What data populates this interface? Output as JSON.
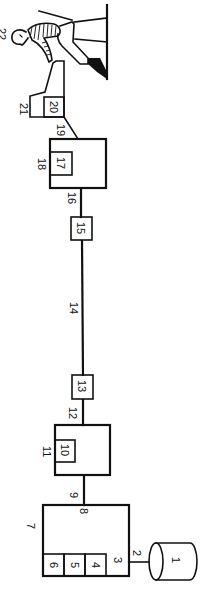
{
  "diagram": {
    "labels": {
      "n1": "1",
      "n2": "2",
      "n3": "3",
      "n4": "4",
      "n5": "5",
      "n6": "6",
      "n7": "7",
      "n8": "8",
      "n9": "9",
      "n10": "10",
      "n11": "11",
      "n12": "12",
      "n13": "13",
      "n14": "14",
      "n15": "15",
      "n16": "16",
      "n17": "17",
      "n18": "18",
      "n19": "19",
      "n20": "20",
      "n21": "21",
      "n22": "22"
    },
    "colors": {
      "stroke": "#111111",
      "background": "#ffffff"
    }
  }
}
